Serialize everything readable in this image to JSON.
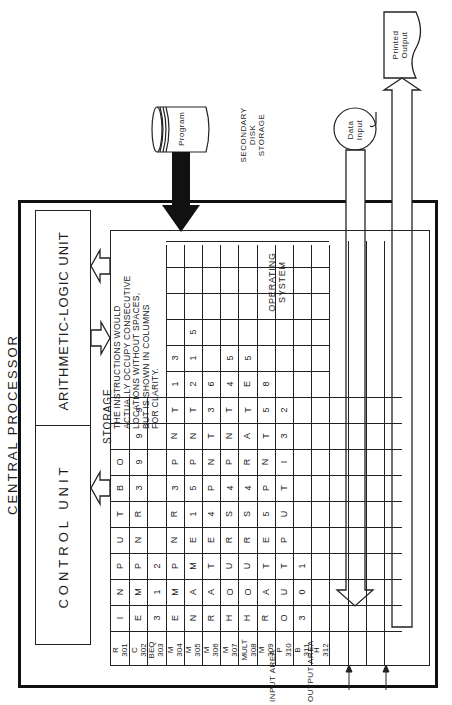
{
  "diagram": {
    "title": "CENTRAL PROCESSOR",
    "units": {
      "alu": "ARITHMETIC-LOGIC UNIT",
      "control": "CONTROL UNIT"
    },
    "storage": {
      "label": "STORAGE",
      "note": [
        "THE INSTRUCTIONS WOULD",
        "ACTUALLY OCCUPY CONSECUTIVE",
        "LOCATIONS WITHOUT SPACES,",
        "BUT IS SHOWN IN COLUMNS",
        "FOR CLARITY."
      ],
      "operating_system_label": [
        "OPERATING",
        "SYSTEM"
      ],
      "rows": [
        {
          "op": "R",
          "addr": "301",
          "cells": [
            "I",
            "N",
            "P",
            "U",
            "T",
            "B",
            "O",
            "",
            ""
          ]
        },
        {
          "op": "C",
          "addr": "302",
          "cells": [
            "E",
            "M",
            "P",
            "N",
            "R",
            "3",
            "9",
            "9",
            "9"
          ]
        },
        {
          "op": "BEQ",
          "addr": "303",
          "cells": [
            "3",
            "1",
            "2",
            "",
            "",
            "",
            "",
            "",
            ""
          ]
        },
        {
          "op": "M",
          "addr": "304",
          "cells": [
            "E",
            "M",
            "P",
            "N",
            "R",
            "3",
            "P",
            "N",
            "T",
            "1",
            "3"
          ]
        },
        {
          "op": "M",
          "addr": "305",
          "cells": [
            "N",
            "A",
            "M",
            "E",
            "1",
            "5",
            "P",
            "N",
            "T",
            "2",
            "1",
            "5"
          ]
        },
        {
          "op": "M",
          "addr": "306",
          "cells": [
            "R",
            "A",
            "T",
            "E",
            "4",
            "P",
            "N",
            "T",
            "3",
            "6"
          ]
        },
        {
          "op": "M",
          "addr": "307",
          "cells": [
            "H",
            "O",
            "U",
            "R",
            "S",
            "4",
            "P",
            "N",
            "T",
            "4",
            "5"
          ]
        },
        {
          "op": "MULT",
          "addr": "308",
          "cells": [
            "H",
            "O",
            "U",
            "R",
            "S",
            "4",
            "R",
            "A",
            "T",
            "E",
            "5"
          ]
        },
        {
          "op": "M",
          "addr": "309",
          "cells": [
            "R",
            "A",
            "T",
            "E",
            "5",
            "P",
            "N",
            "T",
            "5",
            "8"
          ]
        },
        {
          "op": "P",
          "addr": "310",
          "cells": [
            "O",
            "U",
            "T",
            "P",
            "U",
            "T",
            "I",
            "3",
            "2"
          ]
        },
        {
          "op": "B",
          "addr": "311",
          "cells": [
            "3",
            "0",
            "1"
          ]
        },
        {
          "op": "H",
          "addr": "312",
          "cells": []
        }
      ],
      "areas": [
        "INPUT AREA",
        "OUTPUT AREA"
      ]
    },
    "peripherals": {
      "program": "Program",
      "secondary_storage": [
        "SECONDARY",
        "DISK",
        "STORAGE"
      ],
      "data_input": [
        "Data",
        "Input"
      ],
      "printed_output": [
        "Printed",
        "Output"
      ]
    },
    "colors": {
      "ink": "#1a1a1a",
      "paper": "#ffffff"
    }
  }
}
